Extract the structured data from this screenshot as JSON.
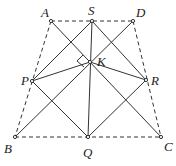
{
  "diagram": {
    "points": {
      "A": {
        "label": "A",
        "x": 51,
        "y": 21
      },
      "S": {
        "label": "S",
        "x": 92,
        "y": 21
      },
      "D": {
        "label": "D",
        "x": 133,
        "y": 21
      },
      "K": {
        "label": "K",
        "x": 90,
        "y": 62
      },
      "P": {
        "label": "P",
        "x": 32,
        "y": 81
      },
      "R": {
        "label": "R",
        "x": 146,
        "y": 80
      },
      "B": {
        "label": "B",
        "x": 15,
        "y": 137
      },
      "Q": {
        "label": "Q",
        "x": 88,
        "y": 137
      },
      "C": {
        "label": "C",
        "x": 161,
        "y": 137
      }
    },
    "dashed_segments": [
      "AD",
      "AB",
      "DC",
      "BC"
    ],
    "solid_segments": [
      "AC",
      "DB",
      "SP",
      "SR",
      "SQ",
      "PQ",
      "RQ",
      "PK",
      "RK"
    ],
    "right_angle_at": "K",
    "line_color": "#333333"
  }
}
